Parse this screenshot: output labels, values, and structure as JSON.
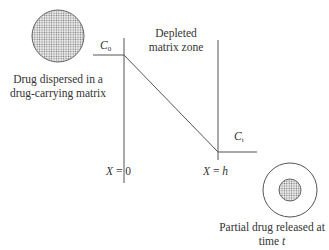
{
  "labels": {
    "dispersed_line1": "Drug dispersed in a",
    "dispersed_line2": "drug-carrying matrix",
    "depleted_line1": "Depleted",
    "depleted_line2": "matrix zone",
    "c0_var": "C",
    "c0_sub": "0",
    "ct_var": "C",
    "ct_sub": "t",
    "x0_var": "X",
    "x0_rest": " = 0",
    "xh_var": "X",
    "xh_eq": " = ",
    "xh_h": "h",
    "released_line1": "Partial drug released at",
    "released_line2_prefix": "time ",
    "released_line2_t": "t"
  },
  "colors": {
    "line": "#555555",
    "dots": "#666666"
  }
}
